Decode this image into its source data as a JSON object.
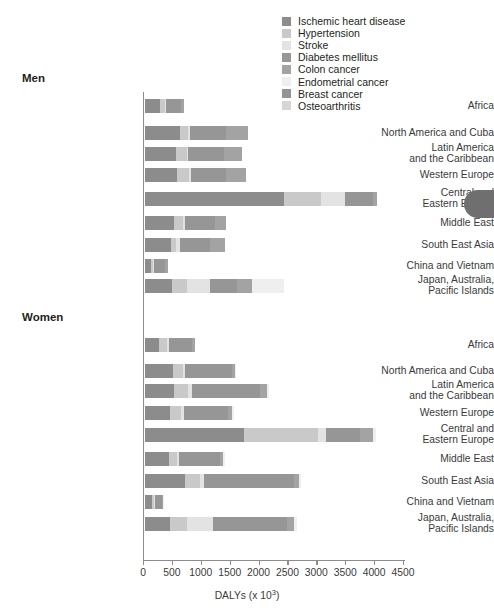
{
  "chart_data": {
    "type": "bar",
    "orientation": "horizontal",
    "stacked": true,
    "title": "",
    "xlabel": "DALYs (x 10³)",
    "ylabel": "",
    "xlim": [
      0,
      4500
    ],
    "xticks": [
      0,
      500,
      1000,
      1500,
      2000,
      2500,
      3000,
      3500,
      4000,
      4500
    ],
    "xticklabels": [
      "0",
      "500",
      "1000",
      "1500",
      "2000",
      "2500",
      "3000",
      "3500",
      "4000",
      "4500"
    ],
    "grid": false,
    "legend_position": "top-right",
    "series": [
      {
        "name": "Ischemic heart disease",
        "color": "#8c8c8c"
      },
      {
        "name": "Hypertension",
        "color": "#c9c9c9"
      },
      {
        "name": "Stroke",
        "color": "#e3e3e3"
      },
      {
        "name": "Diabetes mellitus",
        "color": "#969696"
      },
      {
        "name": "Colon cancer",
        "color": "#a3a3a3"
      },
      {
        "name": "Endometrial cancer",
        "color": "#efefef"
      },
      {
        "name": "Breast cancer",
        "color": "#949494"
      },
      {
        "name": "Osteoarthritis",
        "color": "#d6d6d6"
      }
    ],
    "panels": [
      {
        "label": "Men",
        "categories": [
          "Africa",
          "North America and Cuba",
          "Latin America\nand the Caribbean",
          "Western Europe",
          "Central and\nEastern Europe",
          "Middle East",
          "South East Asia",
          "China and Vietnam",
          "Japan, Australia,\nPacific Islands"
        ],
        "rows": [
          {
            "category": "Africa",
            "values": [
              260,
              90,
              20,
              260,
              40,
              0,
              0,
              0
            ],
            "total": 670
          },
          {
            "category": "North America and Cuba",
            "values": [
              600,
              150,
              30,
              620,
              380,
              0,
              0,
              0
            ],
            "total": 1780
          },
          {
            "category": "Latin America\nand the Caribbean",
            "values": [
              540,
              180,
              30,
              610,
              320,
              0,
              0,
              0
            ],
            "total": 1680
          },
          {
            "category": "Western Europe",
            "values": [
              560,
              200,
              30,
              620,
              340,
              0,
              0,
              0
            ],
            "total": 1750
          },
          {
            "category": "Central and\nEastern Europe",
            "values": [
              2400,
              650,
              420,
              480,
              60,
              0,
              0,
              0
            ],
            "total": 4010
          },
          {
            "category": "Middle East",
            "values": [
              510,
              150,
              30,
              520,
              200,
              0,
              0,
              0
            ],
            "total": 1410
          },
          {
            "category": "South East Asia",
            "values": [
              450,
              90,
              60,
              530,
              260,
              0,
              0,
              0
            ],
            "total": 1390
          },
          {
            "category": "China and Vietnam",
            "values": [
              110,
              30,
              20,
              180,
              60,
              0,
              0,
              0
            ],
            "total": 400
          },
          {
            "category": "Japan, Australia,\nPacific Islands",
            "values": [
              470,
              250,
              400,
              470,
              260,
              550,
              0,
              0
            ],
            "total": 2400
          }
        ]
      },
      {
        "label": "Women",
        "categories": [
          "Africa",
          "North America and Cuba",
          "Latin America\nand the Caribbean",
          "Western Europe",
          "Central and\nEastern Europe",
          "Middle East",
          "South East Asia",
          "China and Vietnam",
          "Japan, Australia,\nPacific Islands"
        ],
        "rows": [
          {
            "category": "Africa",
            "values": [
              250,
              130,
              30,
              400,
              50,
              0,
              0,
              0
            ],
            "total": 860
          },
          {
            "category": "North America and Cuba",
            "values": [
              480,
              180,
              40,
              800,
              60,
              20,
              0,
              0
            ],
            "total": 1580
          },
          {
            "category": "Latin America\nand the Caribbean",
            "values": [
              500,
              250,
              60,
              1180,
              120,
              40,
              0,
              0
            ],
            "total": 2150
          },
          {
            "category": "Western Europe",
            "values": [
              430,
              200,
              50,
              760,
              70,
              30,
              0,
              0
            ],
            "total": 1540
          },
          {
            "category": "Central and\nEastern Europe",
            "values": [
              1710,
              1290,
              130,
              590,
              220,
              60,
              0,
              0
            ],
            "total": 4000
          },
          {
            "category": "Middle East",
            "values": [
              420,
              130,
              40,
              700,
              60,
              30,
              0,
              0
            ],
            "total": 1380
          },
          {
            "category": "South East Asia",
            "values": [
              700,
              250,
              80,
              1550,
              80,
              40,
              0,
              0
            ],
            "total": 2700
          },
          {
            "category": "China and Vietnam",
            "values": [
              120,
              40,
              20,
              110,
              20,
              10,
              0,
              0
            ],
            "total": 320
          },
          {
            "category": "Japan, Australia,\nPacific Islands",
            "values": [
              440,
              290,
              440,
              1290,
              120,
              50,
              0,
              0
            ],
            "total": 2630
          }
        ]
      }
    ]
  },
  "legend": {
    "items": [
      {
        "label": "Ischemic heart disease",
        "color": "#8c8c8c"
      },
      {
        "label": "Hypertension",
        "color": "#c9c9c9"
      },
      {
        "label": "Stroke",
        "color": "#e3e3e3"
      },
      {
        "label": "Diabetes mellitus",
        "color": "#969696"
      },
      {
        "label": "Colon cancer",
        "color": "#a3a3a3"
      },
      {
        "label": "Endometrial cancer",
        "color": "#efefef"
      },
      {
        "label": "Breast cancer",
        "color": "#949494"
      },
      {
        "label": "Osteoarthritis",
        "color": "#d6d6d6"
      }
    ]
  },
  "axis": {
    "label": "DALYs (x 10",
    "label_exp": "3",
    "label_tail": ")"
  },
  "panels_meta": {
    "men_title": "Men",
    "women_title": "Women"
  }
}
